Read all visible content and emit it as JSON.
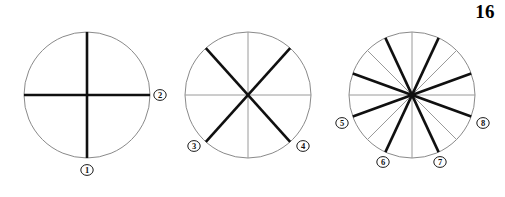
{
  "figure": {
    "number_label": "16",
    "caption": "",
    "background_color": "#ffffff",
    "thin_line_color": "#9a9a9a",
    "thick_line_color": "#101010",
    "outline_color": "#8a8a8a",
    "marker_text_color": "#111111"
  },
  "chart_data": {
    "type": "diagram",
    "title": "16",
    "xlabel": "",
    "ylabel": "",
    "circles": [
      {
        "name": "circle-one",
        "sectors": 4,
        "center_x": 87,
        "center_y": 95,
        "radius": 63,
        "thin_diameter_angles_deg": [],
        "thick_diameter_angles_deg": [
          0,
          90
        ],
        "labels": [
          {
            "text": "1",
            "angle_deg": 270,
            "x": 87,
            "y": 170
          },
          {
            "text": "2",
            "angle_deg": 0,
            "x": 160,
            "y": 95
          }
        ]
      },
      {
        "name": "circle-two",
        "sectors": 6,
        "center_x": 248,
        "center_y": 95,
        "radius": 63,
        "thin_diameter_angles_deg": [
          0,
          90
        ],
        "thick_diameter_angles_deg": [
          48,
          132
        ],
        "labels": [
          {
            "text": "3",
            "angle_deg": 228,
            "x": 194,
            "y": 146
          },
          {
            "text": "4",
            "angle_deg": 312,
            "x": 303,
            "y": 146
          }
        ]
      },
      {
        "name": "circle-three",
        "sectors": 12,
        "center_x": 412,
        "center_y": 95,
        "radius": 63,
        "thin_diameter_angles_deg": [
          0,
          45,
          90,
          135
        ],
        "thick_diameter_angles_deg": [
          20,
          65,
          115,
          160
        ],
        "labels": [
          {
            "text": "5",
            "angle_deg": 200,
            "x": 342,
            "y": 123
          },
          {
            "text": "6",
            "angle_deg": 245,
            "x": 383,
            "y": 162
          },
          {
            "text": "7",
            "angle_deg": 295,
            "x": 440,
            "y": 162
          },
          {
            "text": "8",
            "angle_deg": 340,
            "x": 483,
            "y": 123
          }
        ]
      }
    ],
    "markers": [
      "1",
      "2",
      "3",
      "4",
      "5",
      "6",
      "7",
      "8"
    ]
  }
}
